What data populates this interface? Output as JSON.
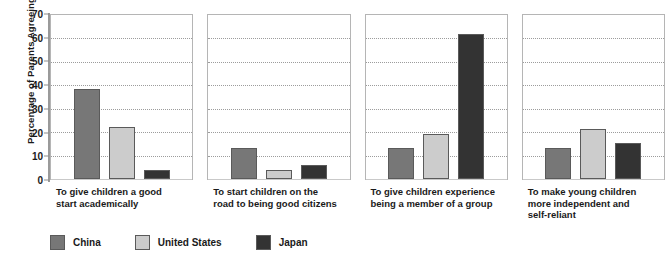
{
  "chart_data": {
    "type": "bar",
    "title": "",
    "subtitle": "",
    "xlabel": "",
    "ylabel": "Percentage of Parents Agreeing",
    "ylim": [
      0,
      70
    ],
    "ytick_step": 10,
    "yticks": [
      70,
      60,
      50,
      40,
      30,
      20,
      10,
      0
    ],
    "grid": true,
    "grid_style": "dotted-horizontal",
    "legend_position": "bottom-left",
    "panel_layout": "four side-by-side panels sharing one y-axis",
    "categories": [
      "To give children a good start academically",
      "To start children on the road to being good citizens",
      "To give children experience being a member of a group",
      "To make young children more independent and self-reliant"
    ],
    "series": [
      {
        "name": "China",
        "color": "#777777",
        "values": [
          38,
          13,
          13,
          13
        ]
      },
      {
        "name": "United States",
        "color": "#cccccc",
        "values": [
          22,
          4,
          19,
          21
        ]
      },
      {
        "name": "Japan",
        "color": "#333333",
        "values": [
          4,
          6,
          61,
          15
        ]
      }
    ]
  },
  "axis": {
    "y_title": "Percentage of Parents Agreeing",
    "y_ticks": [
      "70",
      "60",
      "50",
      "40",
      "30",
      "20",
      "10",
      "0"
    ]
  },
  "panels": [
    {
      "caption_lines": [
        "To give children a good",
        "start academically"
      ]
    },
    {
      "caption_lines": [
        "To start children on the",
        "road to being good citizens"
      ]
    },
    {
      "caption_lines": [
        "To give children experience",
        "being a member of a group"
      ]
    },
    {
      "caption_lines": [
        "To make young children",
        "more independent and",
        "self-reliant"
      ]
    }
  ],
  "legend": {
    "items": [
      {
        "label": "China",
        "color": "#777777"
      },
      {
        "label": "United States",
        "color": "#cccccc"
      },
      {
        "label": "Japan",
        "color": "#333333"
      }
    ]
  }
}
